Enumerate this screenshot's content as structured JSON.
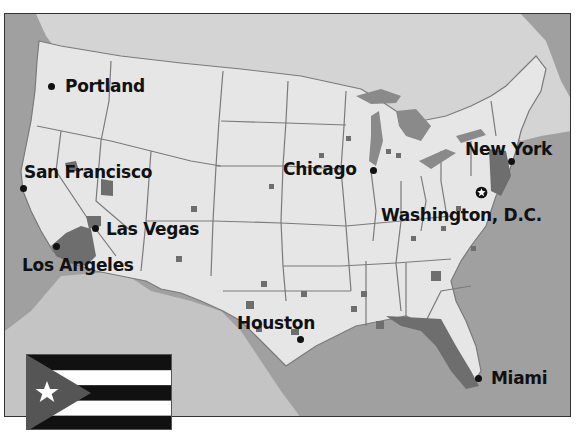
{
  "map": {
    "type": "US map with highlighted metropolitan areas",
    "colors": {
      "ocean": "#9a9a9a",
      "land_us": "#e6e6e6",
      "land_foreign": "#cfcfcf",
      "state_border": "#7a7a7a",
      "highlight": "#6e6e6e",
      "lakes": "#8a8a8a",
      "text": "#111111"
    },
    "cities": [
      {
        "name": "Portland",
        "label": "Portland"
      },
      {
        "name": "San Francisco",
        "label": "San Francisco"
      },
      {
        "name": "Las Vegas",
        "label": "Las Vegas"
      },
      {
        "name": "Los Angeles",
        "label": "Los Angeles"
      },
      {
        "name": "Chicago",
        "label": "Chicago"
      },
      {
        "name": "New York",
        "label": "New York"
      },
      {
        "name": "Washington, D.C.",
        "label": "Washington, D.C.",
        "capital": true
      },
      {
        "name": "Houston",
        "label": "Houston"
      },
      {
        "name": "Miami",
        "label": "Miami"
      }
    ],
    "inset_flag": {
      "name": "Cuba",
      "stripes": [
        "#111111",
        "#ffffff",
        "#111111",
        "#ffffff",
        "#111111"
      ],
      "triangle_color": "#555555",
      "star_color": "#ffffff"
    }
  }
}
